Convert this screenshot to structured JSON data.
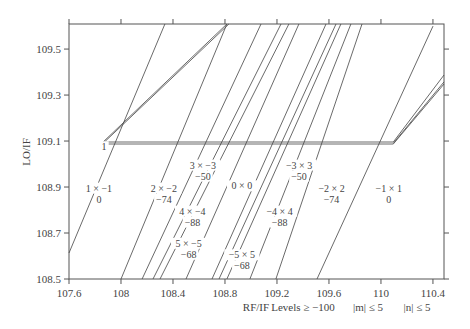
{
  "chart_data": {
    "type": "line",
    "title": "",
    "xlabel": "RF/IF",
    "ylabel": "LO/IF",
    "xlim": [
      107.6,
      110.485
    ],
    "ylim": [
      108.5,
      109.609
    ],
    "xticks": [
      "107.6",
      "108",
      "108.4",
      "108.8",
      "109.2",
      "109.6",
      "110",
      "110.4"
    ],
    "xtick_values": [
      107.6,
      108.0,
      108.4,
      108.8,
      109.2,
      109.6,
      110.0,
      110.4
    ],
    "yticks": [
      "108.5",
      "108.7",
      "108.9",
      "109.1",
      "109.3",
      "109.5"
    ],
    "ytick_values": [
      108.5,
      108.7,
      108.9,
      109.1,
      109.3,
      109.5
    ],
    "grid": false,
    "footer_notes": [
      "Levels ≥ −100",
      "|m| ≤ 5",
      "|n| ≤ 5"
    ],
    "series": [
      {
        "name": "desired-1",
        "points": [
          [
            107.862,
            109.096
          ],
          [
            110.095,
            109.096
          ]
        ]
      },
      {
        "name": "desired-2",
        "points": [
          [
            107.862,
            109.087
          ],
          [
            110.095,
            109.087
          ]
        ]
      },
      {
        "name": "1x-1",
        "points": [
          [
            107.6,
            108.613
          ],
          [
            108.338,
            109.609
          ]
        ]
      },
      {
        "name": "left-fan-a",
        "points": [
          [
            107.862,
            109.096
          ],
          [
            108.815,
            109.609
          ]
        ]
      },
      {
        "name": "left-fan-b",
        "points": [
          [
            107.862,
            109.09
          ],
          [
            108.83,
            109.609
          ]
        ]
      },
      {
        "name": "2x-2",
        "points": [
          [
            108.0,
            108.5
          ],
          [
            108.815,
            109.609
          ]
        ]
      },
      {
        "name": "l3",
        "points": [
          [
            108.162,
            108.5
          ],
          [
            109.077,
            109.609
          ]
        ]
      },
      {
        "name": "l4",
        "points": [
          [
            108.246,
            108.5
          ],
          [
            109.231,
            109.609
          ]
        ]
      },
      {
        "name": "l5",
        "points": [
          [
            108.3,
            108.5
          ],
          [
            109.292,
            109.609
          ]
        ]
      },
      {
        "name": "0x0",
        "points": [
          [
            108.5,
            108.5
          ],
          [
            109.369,
            109.609
          ]
        ]
      },
      {
        "name": "l7",
        "points": [
          [
            108.7,
            108.5
          ],
          [
            109.577,
            109.609
          ]
        ]
      },
      {
        "name": "l8",
        "points": [
          [
            108.754,
            108.5
          ],
          [
            109.654,
            109.609
          ]
        ]
      },
      {
        "name": "l9",
        "points": [
          [
            108.815,
            108.5
          ],
          [
            109.692,
            109.609
          ]
        ]
      },
      {
        "name": "l10",
        "points": [
          [
            108.992,
            108.5
          ],
          [
            109.769,
            109.609
          ]
        ]
      },
      {
        "name": "l11",
        "points": [
          [
            109.192,
            108.5
          ],
          [
            109.854,
            109.609
          ]
        ]
      },
      {
        "name": "-1x1",
        "points": [
          [
            109.508,
            108.5
          ],
          [
            110.4,
            109.6
          ]
        ]
      },
      {
        "name": "right-fan-a",
        "points": [
          [
            110.095,
            109.096
          ],
          [
            110.485,
            109.387
          ]
        ]
      },
      {
        "name": "right-fan-b",
        "points": [
          [
            110.095,
            109.09
          ],
          [
            110.485,
            109.357
          ]
        ]
      },
      {
        "name": "right-fan-c",
        "points": [
          [
            110.095,
            109.087
          ],
          [
            110.485,
            109.348
          ]
        ]
      }
    ],
    "annotations": [
      {
        "id": "ann-1x-1",
        "lines": [
          "1 × −1",
          "0"
        ],
        "x": 107.83,
        "y": 108.88
      },
      {
        "id": "ann-2x-2",
        "lines": [
          "2 × −2",
          "−74"
        ],
        "x": 108.33,
        "y": 108.88
      },
      {
        "id": "ann-3x-3",
        "lines": [
          "3 × −3",
          "−50"
        ],
        "x": 108.63,
        "y": 108.98
      },
      {
        "id": "ann-4x-4",
        "lines": [
          "4 × −4",
          "−88"
        ],
        "x": 108.55,
        "y": 108.78
      },
      {
        "id": "ann-5x-5",
        "lines": [
          "5 × −5",
          "−68"
        ],
        "x": 108.52,
        "y": 108.64
      },
      {
        "id": "ann-0x0",
        "lines": [
          "0 × 0"
        ],
        "x": 108.93,
        "y": 108.89
      },
      {
        "id": "ann--3x3",
        "lines": [
          "−3 × 3",
          "−50"
        ],
        "x": 109.37,
        "y": 108.98
      },
      {
        "id": "ann--2x2",
        "lines": [
          "−2 × 2",
          "−74"
        ],
        "x": 109.62,
        "y": 108.88
      },
      {
        "id": "ann--4x4",
        "lines": [
          "−4 × 4",
          "−88"
        ],
        "x": 109.22,
        "y": 108.78
      },
      {
        "id": "ann--5x5",
        "lines": [
          "−5 × 5",
          "−68"
        ],
        "x": 108.93,
        "y": 108.59
      },
      {
        "id": "ann--1x1",
        "lines": [
          "−1 × 1",
          "0"
        ],
        "x": 110.06,
        "y": 108.88
      },
      {
        "id": "ann-1",
        "lines": [
          "1"
        ],
        "x": 107.87,
        "y": 109.06
      }
    ]
  }
}
